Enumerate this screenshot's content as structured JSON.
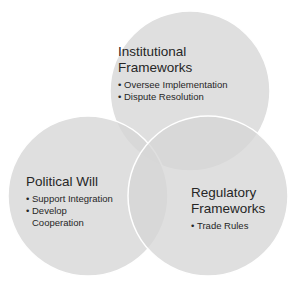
{
  "diagram": {
    "type": "venn-3",
    "circles": [
      {
        "id": "institutional",
        "title_lines": [
          "Institutional",
          "Frameworks"
        ],
        "items": [
          "Oversee Implementation",
          "Dispute Resolution"
        ]
      },
      {
        "id": "political",
        "title_lines": [
          "Political Will"
        ],
        "items": [
          "Support Integration",
          "Develop Cooperation"
        ]
      },
      {
        "id": "regulatory",
        "title_lines": [
          "Regulatory",
          "Frameworks"
        ],
        "items": [
          "Trade Rules"
        ]
      }
    ],
    "colors": {
      "circle_fill": "#d9d9d9",
      "circle_opacity": 0.75,
      "circle_stroke": "#ffffff",
      "text": "#262626"
    }
  }
}
